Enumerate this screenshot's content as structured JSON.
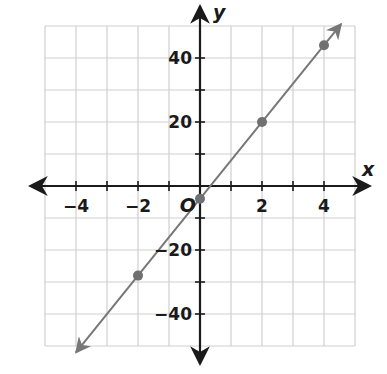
{
  "chart_data": {
    "type": "line",
    "title": "",
    "xlabel": "x",
    "ylabel": "y",
    "origin_label": "O",
    "xlim": [
      -5,
      5
    ],
    "ylim": [
      -50,
      50
    ],
    "grid": true,
    "x_grid_step": 1,
    "y_grid_step": 10,
    "x_ticks": [
      -4,
      -2,
      2,
      4
    ],
    "x_tick_labels": [
      "−4",
      "−2",
      "2",
      "4"
    ],
    "y_ticks": [
      -40,
      -20,
      20,
      40
    ],
    "y_tick_labels": [
      "−40",
      "−20",
      "20",
      "40"
    ],
    "series": [
      {
        "name": "y = 12x − 4",
        "line_color": "#777777",
        "marker_color": "#707070",
        "points": [
          {
            "x": -2,
            "y": -28
          },
          {
            "x": 0,
            "y": -4
          },
          {
            "x": 2,
            "y": 20
          },
          {
            "x": 4,
            "y": 44
          }
        ],
        "arrows_both_ends": true
      }
    ],
    "legend": null,
    "colors": {
      "grid": "#cfcfcf",
      "axis": "#1a1a1a",
      "line": "#777777",
      "point": "#707070"
    }
  }
}
